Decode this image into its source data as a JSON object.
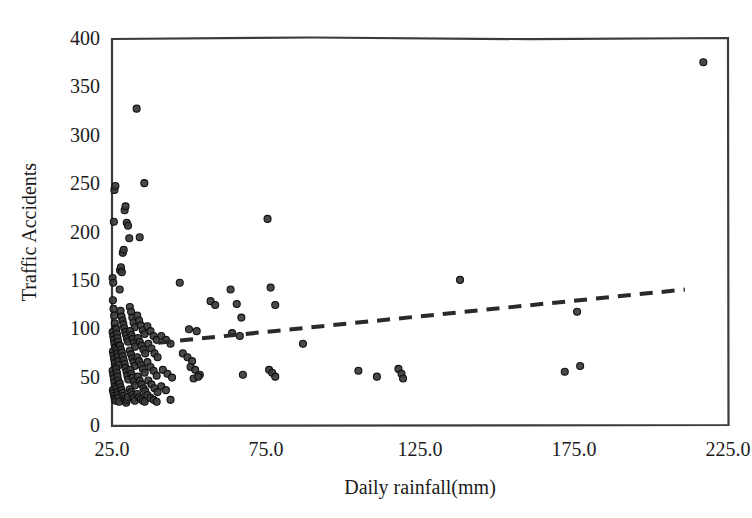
{
  "chart_data": {
    "type": "scatter",
    "title": "",
    "xlabel": "Daily rainfall(mm)",
    "ylabel": "Traffic Accidents",
    "xlim": [
      25.0,
      225.0
    ],
    "ylim": [
      0,
      400
    ],
    "xticks": [
      "25.0",
      "75.0",
      "125.0",
      "175.0",
      "225.0"
    ],
    "xtick_values": [
      25.0,
      75.0,
      125.0,
      175.0,
      225.0
    ],
    "yticks": [
      "0",
      "50",
      "100",
      "150",
      "200",
      "250",
      "300",
      "350",
      "400"
    ],
    "ytick_values": [
      0,
      50,
      100,
      150,
      200,
      250,
      300,
      350,
      400
    ],
    "grid": false,
    "legend": null,
    "marker": {
      "shape": "circle",
      "color": "#3a3a3a",
      "edge_color": "#101010",
      "size_px": 7
    },
    "series": [
      {
        "name": "Traffic Accidents",
        "points": [
          [
            25.2,
            152
          ],
          [
            25.4,
            147
          ],
          [
            25.6,
            210
          ],
          [
            25.8,
            243
          ],
          [
            26.1,
            247
          ],
          [
            25.3,
            129
          ],
          [
            25.5,
            120
          ],
          [
            25.7,
            113
          ],
          [
            25.9,
            105
          ],
          [
            26.2,
            100
          ],
          [
            25.2,
            96
          ],
          [
            25.4,
            92
          ],
          [
            25.6,
            88
          ],
          [
            25.8,
            84
          ],
          [
            26.0,
            80
          ],
          [
            25.3,
            76
          ],
          [
            25.5,
            72
          ],
          [
            25.7,
            68
          ],
          [
            25.9,
            64
          ],
          [
            26.1,
            60
          ],
          [
            25.2,
            56
          ],
          [
            25.4,
            52
          ],
          [
            25.6,
            48
          ],
          [
            25.8,
            44
          ],
          [
            26.0,
            40
          ],
          [
            25.3,
            36
          ],
          [
            25.5,
            33
          ],
          [
            25.7,
            30
          ],
          [
            25.9,
            27
          ],
          [
            26.2,
            25
          ],
          [
            26.4,
            99
          ],
          [
            26.6,
            94
          ],
          [
            26.8,
            90
          ],
          [
            27.0,
            86
          ],
          [
            27.2,
            82
          ],
          [
            26.5,
            78
          ],
          [
            26.7,
            74
          ],
          [
            26.9,
            70
          ],
          [
            27.1,
            66
          ],
          [
            27.3,
            62
          ],
          [
            26.4,
            58
          ],
          [
            26.6,
            54
          ],
          [
            26.8,
            50
          ],
          [
            27.0,
            46
          ],
          [
            27.2,
            42
          ],
          [
            26.5,
            38
          ],
          [
            26.7,
            34
          ],
          [
            26.9,
            31
          ],
          [
            27.1,
            28
          ],
          [
            27.3,
            24
          ],
          [
            27.6,
            160
          ],
          [
            27.9,
            163
          ],
          [
            28.2,
            158
          ],
          [
            28.5,
            178
          ],
          [
            28.8,
            181
          ],
          [
            29.1,
            222
          ],
          [
            29.4,
            226
          ],
          [
            29.8,
            209
          ],
          [
            30.2,
            206
          ],
          [
            30.6,
            193
          ],
          [
            27.5,
            140
          ],
          [
            27.8,
            118
          ],
          [
            28.1,
            112
          ],
          [
            28.4,
            108
          ],
          [
            28.7,
            104
          ],
          [
            29.0,
            100
          ],
          [
            29.3,
            96
          ],
          [
            29.6,
            93
          ],
          [
            29.9,
            89
          ],
          [
            30.2,
            86
          ],
          [
            27.6,
            82
          ],
          [
            27.9,
            78
          ],
          [
            28.2,
            75
          ],
          [
            28.5,
            71
          ],
          [
            28.8,
            67
          ],
          [
            29.1,
            63
          ],
          [
            29.4,
            59
          ],
          [
            29.7,
            55
          ],
          [
            30.0,
            51
          ],
          [
            30.3,
            47
          ],
          [
            27.5,
            43
          ],
          [
            27.8,
            39
          ],
          [
            28.1,
            36
          ],
          [
            28.4,
            33
          ],
          [
            28.7,
            30
          ],
          [
            29.0,
            27
          ],
          [
            29.3,
            25
          ],
          [
            29.6,
            23
          ],
          [
            29.9,
            26
          ],
          [
            30.2,
            29
          ],
          [
            30.8,
            122
          ],
          [
            31.2,
            117
          ],
          [
            31.6,
            111
          ],
          [
            32.0,
            106
          ],
          [
            32.4,
            101
          ],
          [
            30.9,
            97
          ],
          [
            31.3,
            93
          ],
          [
            31.7,
            89
          ],
          [
            32.1,
            85
          ],
          [
            32.5,
            81
          ],
          [
            30.8,
            77
          ],
          [
            31.2,
            73
          ],
          [
            31.6,
            69
          ],
          [
            32.0,
            65
          ],
          [
            32.4,
            61
          ],
          [
            30.9,
            57
          ],
          [
            31.3,
            53
          ],
          [
            31.7,
            49
          ],
          [
            32.1,
            45
          ],
          [
            32.5,
            41
          ],
          [
            30.8,
            37
          ],
          [
            31.2,
            34
          ],
          [
            31.6,
            31
          ],
          [
            32.0,
            28
          ],
          [
            32.4,
            25
          ],
          [
            33.0,
            327
          ],
          [
            35.5,
            250
          ],
          [
            34.0,
            194
          ],
          [
            33.2,
            113
          ],
          [
            33.8,
            108
          ],
          [
            34.4,
            103
          ],
          [
            35.0,
            98
          ],
          [
            35.6,
            94
          ],
          [
            33.4,
            90
          ],
          [
            34.0,
            86
          ],
          [
            34.6,
            82
          ],
          [
            35.2,
            78
          ],
          [
            35.8,
            74
          ],
          [
            33.2,
            70
          ],
          [
            33.8,
            66
          ],
          [
            34.4,
            62
          ],
          [
            35.0,
            58
          ],
          [
            35.6,
            54
          ],
          [
            33.4,
            50
          ],
          [
            34.0,
            46
          ],
          [
            34.6,
            42
          ],
          [
            35.2,
            38
          ],
          [
            35.8,
            35
          ],
          [
            33.2,
            32
          ],
          [
            33.8,
            29
          ],
          [
            34.4,
            27
          ],
          [
            35.0,
            25
          ],
          [
            35.6,
            24
          ],
          [
            36.5,
            102
          ],
          [
            37.5,
            97
          ],
          [
            38.5,
            92
          ],
          [
            39.5,
            88
          ],
          [
            36.8,
            84
          ],
          [
            37.8,
            79
          ],
          [
            38.8,
            74
          ],
          [
            39.8,
            70
          ],
          [
            36.5,
            65
          ],
          [
            37.5,
            60
          ],
          [
            38.5,
            56
          ],
          [
            39.5,
            51
          ],
          [
            36.8,
            46
          ],
          [
            37.8,
            42
          ],
          [
            38.8,
            38
          ],
          [
            39.8,
            34
          ],
          [
            36.5,
            31
          ],
          [
            37.5,
            28
          ],
          [
            38.5,
            26
          ],
          [
            39.5,
            24
          ],
          [
            41.0,
            92
          ],
          [
            42.5,
            88
          ],
          [
            44.0,
            84
          ],
          [
            41.5,
            57
          ],
          [
            43.0,
            53
          ],
          [
            44.5,
            49
          ],
          [
            41.0,
            40
          ],
          [
            42.5,
            36
          ],
          [
            44.0,
            26
          ],
          [
            47.0,
            147
          ],
          [
            50.0,
            99
          ],
          [
            52.5,
            97
          ],
          [
            48.0,
            74
          ],
          [
            49.5,
            70
          ],
          [
            51.0,
            66
          ],
          [
            50.5,
            60
          ],
          [
            52.0,
            57
          ],
          [
            53.5,
            52
          ],
          [
            51.5,
            48
          ],
          [
            53.0,
            50
          ],
          [
            57.0,
            128
          ],
          [
            58.5,
            124
          ],
          [
            63.5,
            140
          ],
          [
            65.5,
            125
          ],
          [
            67.0,
            111
          ],
          [
            64.0,
            95
          ],
          [
            66.5,
            92
          ],
          [
            67.5,
            52
          ],
          [
            75.5,
            213
          ],
          [
            76.5,
            142
          ],
          [
            78.0,
            124
          ],
          [
            76.0,
            57
          ],
          [
            77.0,
            54
          ],
          [
            78.0,
            50
          ],
          [
            87.0,
            84
          ],
          [
            105.0,
            56
          ],
          [
            111.0,
            50
          ],
          [
            118.0,
            58
          ],
          [
            119.0,
            53
          ],
          [
            119.5,
            48
          ],
          [
            138.0,
            150
          ],
          [
            172.0,
            55
          ],
          [
            177.0,
            61
          ],
          [
            176.0,
            117
          ],
          [
            217.0,
            375
          ]
        ]
      }
    ],
    "trendline": {
      "style": "dashed",
      "color": "#2a2a2a",
      "x_start": 40.0,
      "y_start": 85,
      "x_end": 211.0,
      "y_end": 140
    }
  },
  "axes": {
    "x_title": "Daily rainfall(mm)",
    "y_title": "Traffic Accidents"
  }
}
